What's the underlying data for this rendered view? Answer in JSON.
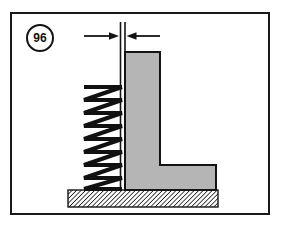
{
  "figure": {
    "number": "96",
    "badge_shape": "circle"
  },
  "colors": {
    "line": "#141414",
    "frame": "#1a1a1a",
    "bracket_fill": "#b5b5b5",
    "bracket_stroke": "#141414",
    "spring_stroke": "#111111",
    "ground_hatch": "#1d1d1d",
    "background": "#ffffff"
  },
  "drawing": {
    "type": "mechanical-assembly-diagram",
    "frame": {
      "x": 10,
      "y": 12,
      "width": 260,
      "height": 203,
      "stroke_width": 2
    },
    "dimension": {
      "label": "",
      "line_y": 24,
      "left_tail_x": 74,
      "left_arrow_tip_x": 108,
      "right_arrow_tip_x": 117,
      "right_tail_x": 150,
      "arrow_direction": "inward",
      "extension_line_left_x": 110,
      "extension_line_right_x": 115,
      "extension_top_y": 10,
      "extension_left_bottom_y": 178,
      "extension_right_bottom_y": 40
    },
    "spring": {
      "name": "coil-spring",
      "left_x": 74,
      "right_x": 112,
      "top_y": 73,
      "bottom_y": 178,
      "coil_count": 8,
      "wire_width": 4,
      "view": "side-elevation"
    },
    "bracket": {
      "name": "l-bracket",
      "shape": "L",
      "vertical_leg": {
        "left_x": 115,
        "right_x": 150,
        "top_y": 40,
        "bottom_y": 178
      },
      "horizontal_foot": {
        "left_x": 115,
        "right_x": 206,
        "top_y": 153,
        "bottom_y": 178
      },
      "fill": "#b5b5b5",
      "stroke_width": 2
    },
    "ground": {
      "name": "hatched-ground",
      "left_x": 58,
      "right_x": 208,
      "top_y": 178,
      "bottom_y": 195,
      "pattern": "diagonal-hatch",
      "hatch_spacing": 3,
      "hatch_angle_deg": 45
    }
  }
}
